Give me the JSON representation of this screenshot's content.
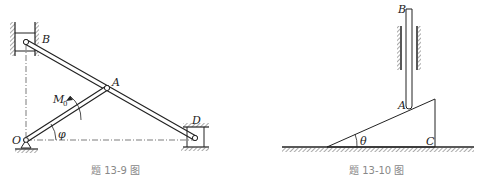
{
  "figures": [
    {
      "id": "fig-13-9",
      "caption": "题 13-9 图",
      "labels": {
        "B": "B",
        "A": "A",
        "M0_main": "M",
        "M0_sub": "0",
        "O": "O",
        "phi": "φ",
        "D": "D"
      },
      "description": "Mechanism: crank OA pivoted at O drives rod BD; slider B in vertical guide, slider D in horizontal guide; moment M0 applied on OA; angle φ between OA and horizontal"
    },
    {
      "id": "fig-13-10",
      "caption": "题 13-10 图",
      "labels": {
        "B": "B",
        "A": "A",
        "theta": "θ",
        "C": "C"
      },
      "description": "Vertical rod AB in fixed guides resting at A on wedge with incline angle θ, right-angle corner at C on the ground"
    }
  ],
  "colors": {
    "line": "#222222",
    "dashdot": "#444444",
    "hatch": "#555555",
    "caption": "#888888"
  }
}
